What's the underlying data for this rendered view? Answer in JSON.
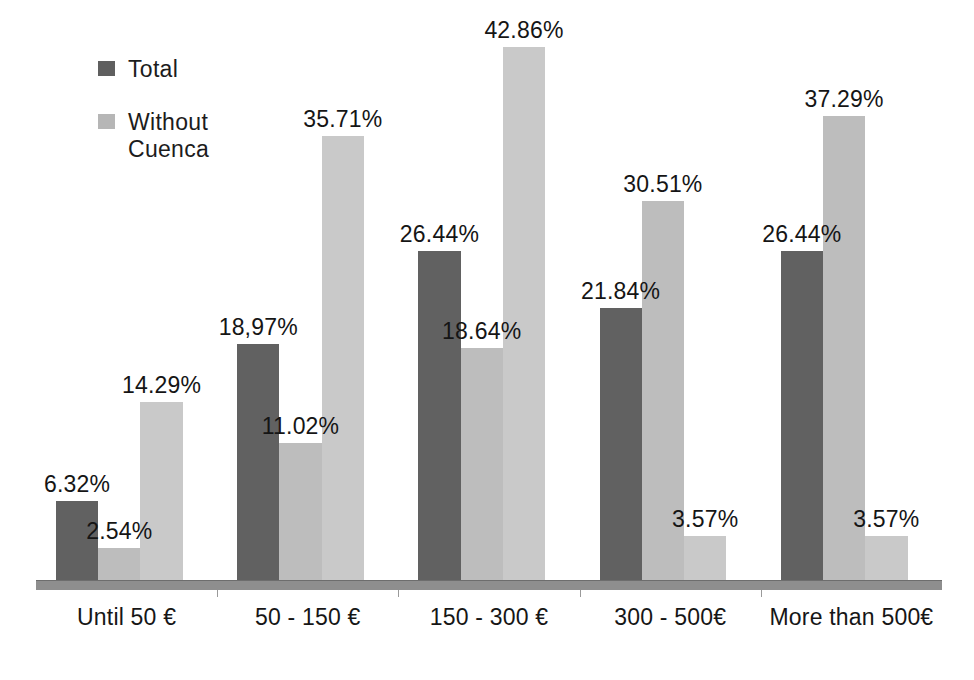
{
  "chart_data": {
    "type": "bar",
    "title": "",
    "subtitle": "",
    "xlabel": "",
    "ylabel": "",
    "ylim": [
      0,
      46
    ],
    "grid": false,
    "legend_position": "top-left",
    "categories": [
      "Until 50 €",
      "50 - 150 €",
      "150 - 300 €",
      "300 - 500€",
      "More than 500€"
    ],
    "series": [
      {
        "name": "Total",
        "color": "#616161",
        "values": [
          6.32,
          18.97,
          26.44,
          21.84,
          26.44
        ],
        "labels": [
          "6.32%",
          "18,97%",
          "26.44%",
          "21.84%",
          "26.44%"
        ]
      },
      {
        "name": "Without Cuenca",
        "color": "#bdbdbd",
        "values": [
          2.54,
          11.02,
          18.64,
          30.51,
          37.29
        ],
        "labels": [
          "2.54%",
          "11.02%",
          "18.64%",
          "30.51%",
          "37.29%"
        ]
      },
      {
        "name": "",
        "color": "#c9c9c9",
        "values": [
          14.29,
          35.71,
          42.86,
          3.57,
          3.57
        ],
        "labels": [
          "14.29%",
          "35.71%",
          "42.86%",
          "3.57%",
          "3.57%"
        ]
      }
    ]
  },
  "legend": {
    "items": [
      {
        "label": "Total",
        "swatch": "dark"
      },
      {
        "label": "Without\nCuenca",
        "swatch": "light"
      }
    ]
  }
}
